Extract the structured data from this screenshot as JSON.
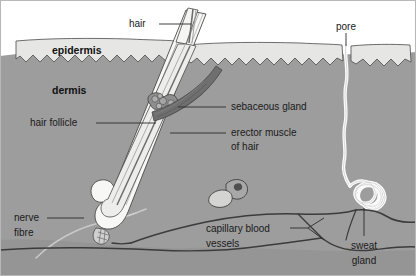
{
  "figure": {
    "width": 416,
    "height": 276
  },
  "colors": {
    "background": "#ffffff",
    "epidermis": "#e6e6e4",
    "dermis": "#9d9d9d",
    "subcutaneous": "#8e8e8e",
    "outline": "#4a4a4a",
    "hair_shaft": "#f2f2f2",
    "hair_shaft_stripe": "#6d6d6d",
    "muscle": "#6f6f6f",
    "sebaceous": "#8a8a8a",
    "sweat_duct": "#fbfbfb",
    "capillary": "#3b3b3b",
    "nerve": "#c9c9c9",
    "label_text": "#1a1a1a",
    "leader_line": "#2b2b2b",
    "border": "#b8b8b8"
  },
  "labels": {
    "hair": "hair",
    "pore": "pore",
    "epidermis": "epidermis",
    "dermis": "dermis",
    "hair_follicle": "hair follicle",
    "sebaceous_gland": "sebaceous gland",
    "erector_muscle_line1": "erector muscle",
    "erector_muscle_line2": "of hair",
    "nerve_fibre_line1": "nerve",
    "nerve_fibre_line2": "fibre",
    "capillary_line1": "capillary blood",
    "capillary_line2": "vessels",
    "sweat_gland_line1": "sweat",
    "sweat_gland_line2": "gland"
  },
  "structures": [
    {
      "id": "hair-shaft",
      "name": "hair"
    },
    {
      "id": "pore-opening",
      "name": "pore"
    },
    {
      "id": "epidermis-layer",
      "name": "epidermis"
    },
    {
      "id": "dermis-layer",
      "name": "dermis"
    },
    {
      "id": "hair-follicle",
      "name": "hair follicle"
    },
    {
      "id": "sebaceous-gland",
      "name": "sebaceous gland"
    },
    {
      "id": "erector-muscle",
      "name": "erector muscle of hair"
    },
    {
      "id": "nerve-fibre",
      "name": "nerve fibre"
    },
    {
      "id": "capillary-vessels",
      "name": "capillary blood vessels"
    },
    {
      "id": "sweat-gland",
      "name": "sweat gland"
    },
    {
      "id": "sweat-duct",
      "name": "sweat duct"
    },
    {
      "id": "fat-cells",
      "name": "fat cells"
    },
    {
      "id": "hair-bulb",
      "name": "hair bulb"
    }
  ]
}
